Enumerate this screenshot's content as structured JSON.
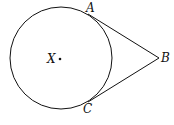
{
  "diagram": {
    "type": "geometry",
    "circle": {
      "center_label": "X",
      "cx": 61,
      "cy": 58,
      "r": 51
    },
    "points": [
      {
        "label": "A",
        "x": 88,
        "y": 14
      },
      {
        "label": "B",
        "x": 159,
        "y": 58
      },
      {
        "label": "C",
        "x": 88,
        "y": 102
      }
    ],
    "segments": [
      [
        "A",
        "B"
      ],
      [
        "C",
        "B"
      ]
    ],
    "labels": {
      "X": "X",
      "A": "A",
      "B": "B",
      "C": "C"
    },
    "caption": ""
  }
}
